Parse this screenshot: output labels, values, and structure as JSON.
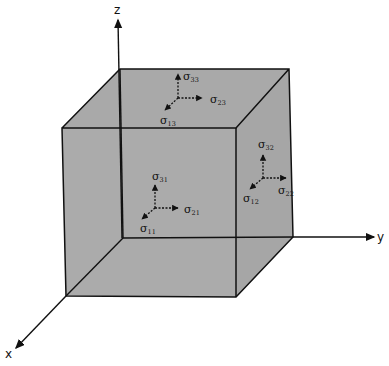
{
  "diagram": {
    "colors": {
      "face_fill": "#a9a9a9",
      "edge": "#111111",
      "background": "#ffffff"
    },
    "axes": {
      "x": "x",
      "y": "y",
      "z": "z"
    },
    "faces": {
      "top": {
        "normal_label": {
          "sym": "σ",
          "sub": "33"
        },
        "shear_y_label": {
          "sym": "σ",
          "sub": "23"
        },
        "shear_x_label": {
          "sym": "σ",
          "sub": "13"
        }
      },
      "front": {
        "normal_label": {
          "sym": "σ",
          "sub": "11"
        },
        "shear_y_label": {
          "sym": "σ",
          "sub": "21"
        },
        "shear_z_label": {
          "sym": "σ",
          "sub": "31"
        }
      },
      "right": {
        "normal_label": {
          "sym": "σ",
          "sub": "22"
        },
        "shear_z_label": {
          "sym": "σ",
          "sub": "32"
        },
        "shear_x_label": {
          "sym": "σ",
          "sub": "12"
        }
      }
    }
  }
}
